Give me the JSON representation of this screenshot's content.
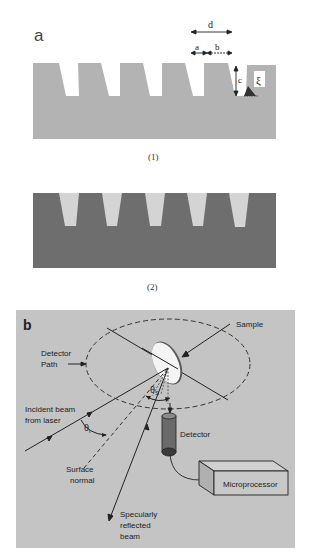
{
  "panel_a": {
    "label": "a",
    "dimension_labels": {
      "d": "d",
      "a": "a",
      "b": "b",
      "c": "c",
      "xi": "ξ"
    },
    "subfigure_1_caption": "(1)",
    "subfigure_2_caption": "(2)",
    "colors": {
      "substrate_1": "#b3b3b3",
      "substrate_2": "#6e6e6e",
      "groove_2": "#d4d4d4"
    },
    "groove_count": 5
  },
  "panel_b": {
    "label": "b",
    "labels": {
      "sample": "Sample",
      "detector_path_1": "Detector",
      "detector_path_2": "Path",
      "incident_1": "Incident beam",
      "incident_2": "from laser",
      "theta_i": "θ",
      "theta_i_sub": "i",
      "theta_s": "θ",
      "theta_s_sub": "S",
      "detector": "Detector",
      "surface_1": "Surface",
      "surface_2": "normal",
      "specular_1": "Specularly",
      "specular_2": "reflected",
      "specular_3": "beam",
      "microprocessor": "Microprocessor"
    },
    "colors": {
      "background": "#c4c4c4",
      "line": "#2a2a2a",
      "sample_face": "#f4f4f4"
    }
  }
}
